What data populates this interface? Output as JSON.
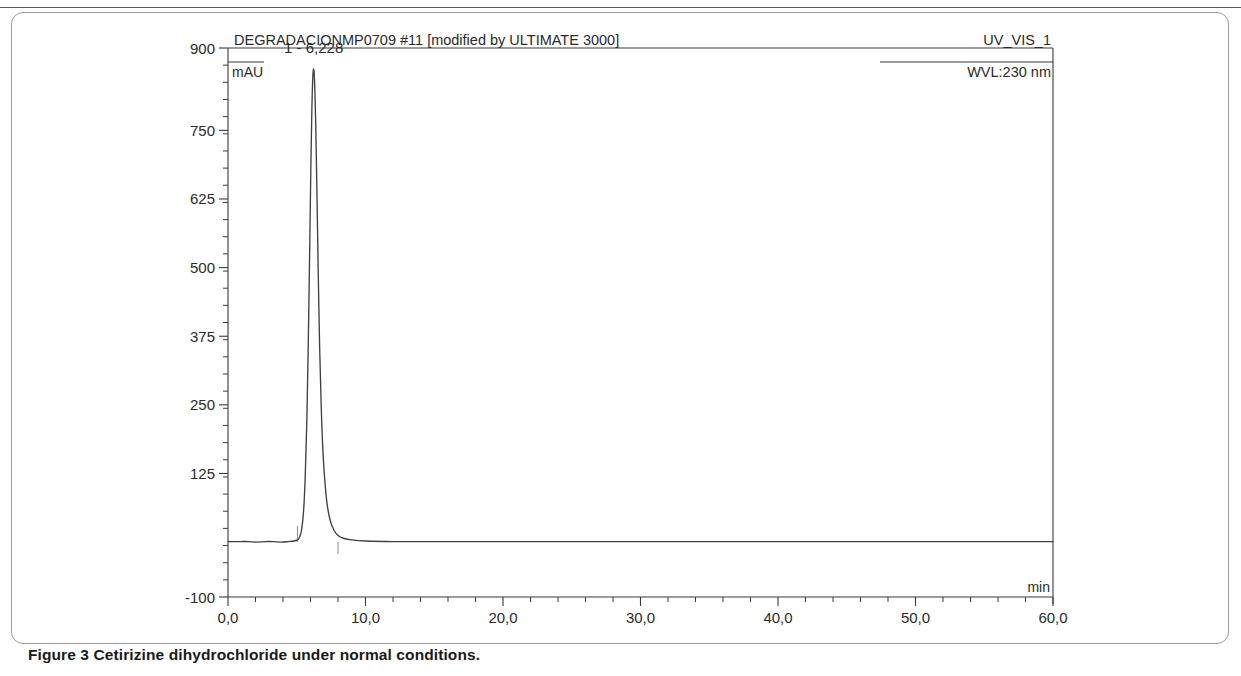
{
  "figure": {
    "caption_label": "Figure 3",
    "caption_text": "Cetirizine dihydrochloride under normal conditions."
  },
  "chart_data": {
    "type": "line",
    "title": "DEGRADACIONMP0709 #11 [modified by ULTIMATE 3000]",
    "detector_label": "UV_VIS_1",
    "wavelength_label": "WVL:230 nm",
    "xlabel": "min",
    "ylabel": "mAU",
    "xlim": [
      0.0,
      60.0
    ],
    "ylim": [
      -100,
      900
    ],
    "grid": false,
    "legend": "none",
    "xticks": [
      0.0,
      10.0,
      20.0,
      30.0,
      40.0,
      50.0,
      60.0
    ],
    "xtick_labels": [
      "0,0",
      "10,0",
      "20,0",
      "30,0",
      "40,0",
      "50,0",
      "60,0"
    ],
    "x_minor_tick_step": 2.0,
    "yticks": [
      -100,
      125,
      250,
      375,
      500,
      625,
      750,
      900
    ],
    "ytick_labels": [
      "-100",
      "125",
      "250",
      "375",
      "500",
      "625",
      "750",
      "900"
    ],
    "y_minor_tick_step": 31.25,
    "annotations": [
      {
        "text": "1 - 6,228",
        "x": 6.228,
        "y": 880
      }
    ],
    "peaks": [
      {
        "index": 1,
        "retention_time": 6.228,
        "height_mau": 862,
        "label": "1 - 6,228",
        "integration_start_min": 5.05,
        "integration_end_min": 8.0
      }
    ],
    "series": [
      {
        "name": "UV_VIS_1 230 nm",
        "color": "#404040",
        "x": [
          0.0,
          0.4,
          0.9,
          1.5,
          2.1,
          2.7,
          3.3,
          3.9,
          4.4,
          4.8,
          5.05,
          5.2,
          5.35,
          5.5,
          5.62,
          5.74,
          5.85,
          5.95,
          6.03,
          6.1,
          6.16,
          6.2,
          6.228,
          6.26,
          6.31,
          6.38,
          6.46,
          6.55,
          6.65,
          6.78,
          6.92,
          7.08,
          7.25,
          7.45,
          7.7,
          8.0,
          8.4,
          9.0,
          10.0,
          12.0,
          15.0,
          20.0,
          25.0,
          30.0,
          35.0,
          40.0,
          45.0,
          50.0,
          55.0,
          60.0
        ],
        "y": [
          1,
          1,
          1,
          1,
          0,
          1,
          1,
          0,
          1,
          2,
          4,
          9,
          22,
          58,
          122,
          228,
          382,
          548,
          690,
          790,
          843,
          858,
          862,
          856,
          830,
          762,
          650,
          510,
          372,
          246,
          158,
          100,
          62,
          38,
          22,
          12,
          7,
          4,
          2,
          1,
          1,
          1,
          1,
          1,
          1,
          1,
          1,
          1,
          1,
          1
        ]
      }
    ],
    "integration_marks": [
      {
        "x": 5.05,
        "type": "start-tick"
      },
      {
        "x": 8.0,
        "type": "end-tick"
      }
    ]
  }
}
